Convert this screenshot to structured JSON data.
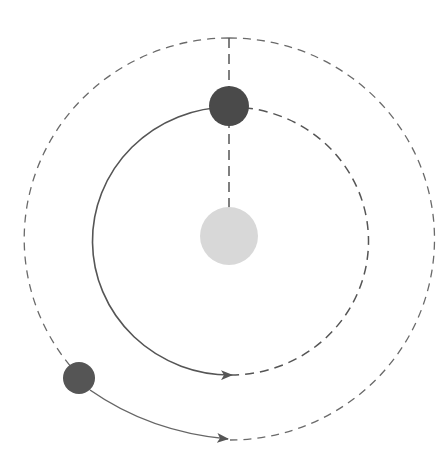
{
  "diagram": {
    "colors": {
      "central_body": "#d8d8d8",
      "orbiting_body": "#4a4a4a",
      "line": "#6a6a6a",
      "background": "#ffffff"
    },
    "elements": {
      "central_body": "light central body",
      "orbiting_body_top": "dark body on inner orbit",
      "orbiting_body_outer": "dark body on outer orbit",
      "inner_orbit": "inner orbit (solid arc with arrow, remainder dashed)",
      "outer_orbit": "outer orbit (solid arc with arrow, remainder dashed)"
    }
  }
}
